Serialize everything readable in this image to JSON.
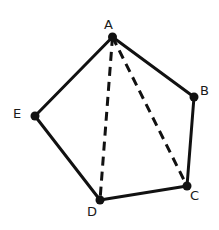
{
  "diagram": {
    "stroke_color": "#111111",
    "points": {
      "A": {
        "label": "A",
        "x": 112.5,
        "y": 37
      },
      "B": {
        "label": "B",
        "x": 194,
        "y": 97
      },
      "C": {
        "label": "C",
        "x": 187,
        "y": 186
      },
      "D": {
        "label": "D",
        "x": 100,
        "y": 200
      },
      "E": {
        "label": "E",
        "x": 35,
        "y": 116
      }
    },
    "sides": [
      "AB",
      "BC",
      "CD",
      "DE",
      "EA"
    ],
    "diagonals_dashed": [
      "AD",
      "AC"
    ]
  }
}
